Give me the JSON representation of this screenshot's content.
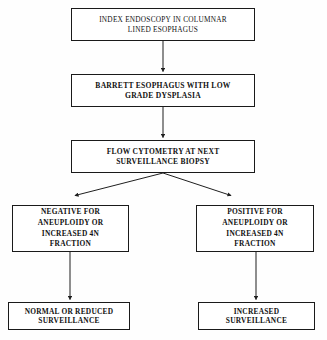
{
  "diagram": {
    "type": "flowchart",
    "orientation": "top-down",
    "colors": {
      "box_border": "#1a1a1a",
      "box_fill": "#ffffff",
      "connector": "#1f1f1f",
      "text": "#111111",
      "background": "#fefefe"
    },
    "nodes": [
      {
        "id": "index-endoscopy",
        "label": "INDEX ENDOSCOPY IN COLUMNAR\nLINED ESOPHAGUS",
        "bold": false
      },
      {
        "id": "barrett-low-grade-dysplasia",
        "label": "BARRETT ESOPHAGUS WITH LOW\nGRADE DYSPLASIA",
        "bold": true
      },
      {
        "id": "flow-cytometry",
        "label": "FLOW CYTOMETRY AT NEXT\nSURVEILLANCE BIOPSY",
        "bold": true
      },
      {
        "id": "negative-result",
        "label": "NEGATIVE FOR\nANEUPLOIDY OR\nINCREASED 4N\nFRACTION",
        "bold": true
      },
      {
        "id": "positive-result",
        "label": "POSITIVE FOR\nANEUPLOIDY OR\nINCREASED 4N\nFRACTION",
        "bold": true
      },
      {
        "id": "normal-reduced-surveillance",
        "label": "NORMAL OR REDUCED\nSURVEILLANCE",
        "bold": true
      },
      {
        "id": "increased-surveillance",
        "label": "INCREASED\nSURVEILLANCE",
        "bold": true
      }
    ],
    "edges": [
      {
        "from": "index-endoscopy",
        "to": "barrett-low-grade-dysplasia",
        "style": "vertical-arrow"
      },
      {
        "from": "barrett-low-grade-dysplasia",
        "to": "flow-cytometry",
        "style": "vertical-arrow"
      },
      {
        "from": "flow-cytometry",
        "to": "negative-result",
        "style": "diagonal-arrow-left"
      },
      {
        "from": "flow-cytometry",
        "to": "positive-result",
        "style": "diagonal-arrow-right"
      },
      {
        "from": "negative-result",
        "to": "normal-reduced-surveillance",
        "style": "vertical-arrow"
      },
      {
        "from": "positive-result",
        "to": "increased-surveillance",
        "style": "vertical-arrow"
      }
    ]
  }
}
